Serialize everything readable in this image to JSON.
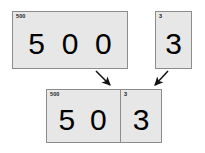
{
  "diagram": {
    "background_color": "#ffffff",
    "card_fill_color": "#e7e7e7",
    "card_border_color": "#8c8c8c",
    "digit_color": "#000000"
  },
  "cards": {
    "top_left": {
      "name": "hundreds-card",
      "label": "500",
      "digits": [
        "5",
        "0",
        "0"
      ]
    },
    "top_right": {
      "name": "ones-card",
      "label": "3",
      "digits": [
        "3"
      ]
    },
    "bottom_left": {
      "name": "result-hundreds-part",
      "label": "500",
      "digits": [
        "5",
        "0"
      ]
    },
    "bottom_right": {
      "name": "result-ones-part",
      "label": "3",
      "digits": [
        "3"
      ]
    }
  },
  "arrows": [
    {
      "name": "arrow-from-hundreds",
      "direction": "down-right"
    },
    {
      "name": "arrow-from-ones",
      "direction": "down-left"
    }
  ]
}
